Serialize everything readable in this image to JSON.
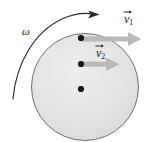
{
  "figure": {
    "type": "physics-diagram",
    "width": 146,
    "height": 142,
    "background_color": "#ffffff",
    "disk": {
      "name": "rotating-disk",
      "center_x": 85,
      "center_y": 87,
      "radius": 54,
      "fill_color": "#e3e3e3",
      "stroke_color": "#6e6e6e"
    },
    "points": [
      {
        "label": "",
        "x": 81,
        "y": 38,
        "radius": 3.0,
        "color": "#1a1a1a",
        "name": "point-outer"
      },
      {
        "label": "",
        "x": 81,
        "y": 64,
        "radius": 3.0,
        "color": "#1a1a1a",
        "name": "point-middle"
      },
      {
        "label": "",
        "x": 81,
        "y": 89,
        "radius": 3.0,
        "color": "#1a1a1a",
        "name": "point-center"
      }
    ],
    "vectors": [
      {
        "name": "velocity-vector-1",
        "label": "v",
        "subscript": "1",
        "has_overbar_arrow": true,
        "tail_x": 82,
        "tail_y": 39,
        "head_x": 140,
        "head_y": 39,
        "color": "#b8b8b8",
        "label_x": 124,
        "label_y": 10
      },
      {
        "name": "velocity-vector-2",
        "label": "v",
        "subscript": "2",
        "has_overbar_arrow": true,
        "tail_x": 82,
        "tail_y": 64,
        "head_x": 118,
        "head_y": 64,
        "color": "#b8b8b8",
        "label_x": 96,
        "label_y": 44
      }
    ],
    "angular_velocity": {
      "name": "angular-velocity-arc",
      "symbol": "ω",
      "label_x": 22,
      "label_y": 26,
      "color": "#2b2b2b",
      "direction": "counterclockwise-drawn-left-to-top-right"
    }
  }
}
